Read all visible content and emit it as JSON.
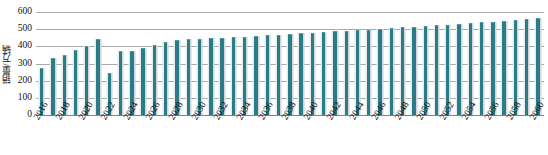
{
  "chart_data": {
    "type": "bar",
    "title": "",
    "subtitle": "",
    "xlabel": "",
    "ylabel": "销量/万辆",
    "ylim": [
      0,
      600
    ],
    "ytick_labels": [
      "600",
      "500",
      "400",
      "300",
      "200",
      "100",
      "0"
    ],
    "ytick_values": [
      600,
      500,
      400,
      300,
      200,
      100,
      0
    ],
    "grid": true,
    "legend": "none",
    "bar_color": "#2c7b88",
    "categories": [
      "2016",
      "2017",
      "2018",
      "2019",
      "2020",
      "2021",
      "2022",
      "2023",
      "2024",
      "2025",
      "2026",
      "2027",
      "2028",
      "2029",
      "2030",
      "2031",
      "2032",
      "2033",
      "2034",
      "2035",
      "2036",
      "2037",
      "2038",
      "2039",
      "2040",
      "2041",
      "2042",
      "2043",
      "2044",
      "2045",
      "2046",
      "2047",
      "2048",
      "2049",
      "2050",
      "2051",
      "2052",
      "2053",
      "2054",
      "2055",
      "2056",
      "2057",
      "2058",
      "2059",
      "2060"
    ],
    "xtick_labels_shown": [
      "2016",
      "2018",
      "2020",
      "2022",
      "2024",
      "2026",
      "2028",
      "2030",
      "2032",
      "2034",
      "2036",
      "2038",
      "2040",
      "2042",
      "2044",
      "2046",
      "2048",
      "2050",
      "2052",
      "2054",
      "2056",
      "2058",
      "2060"
    ],
    "values": [
      272,
      334,
      352,
      380,
      400,
      440,
      245,
      373,
      374,
      390,
      410,
      424,
      438,
      440,
      443,
      446,
      450,
      453,
      457,
      460,
      464,
      468,
      472,
      476,
      480,
      483,
      487,
      490,
      494,
      498,
      502,
      506,
      510,
      515,
      519,
      523,
      527,
      531,
      535,
      539,
      543,
      548,
      552,
      557,
      565
    ]
  }
}
